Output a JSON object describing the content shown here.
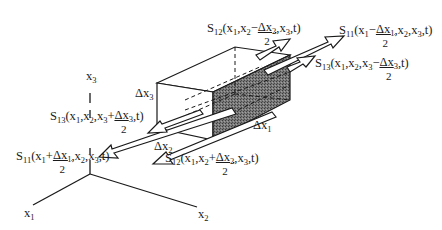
{
  "figure": {
    "type": "3D control-volume stress diagram",
    "axes": {
      "x1": {
        "label": "x",
        "sub": "1"
      },
      "x2": {
        "label": "x",
        "sub": "2"
      },
      "x3": {
        "label": "x",
        "sub": "3"
      }
    },
    "dimensions": {
      "dx1": {
        "label": "Δx",
        "sub": "1"
      },
      "dx2": {
        "label": "Δx",
        "sub": "2"
      },
      "dx3": {
        "label": "Δx",
        "sub": "3"
      }
    },
    "stress_labels": [
      {
        "id": "s12_minus",
        "S": "S",
        "S_sub": "12",
        "pre": "(x",
        "pre_sub": "1",
        "mid": ",x",
        "mid_sub": "2",
        "sign": "−",
        "frac_num": "Δx",
        "frac_num_sub": "2",
        "frac_den": "2",
        "post": ",x",
        "post_sub": "3",
        "end": ",t)"
      },
      {
        "id": "s11_minus",
        "S": "S",
        "S_sub": "11",
        "pre": "(x",
        "pre_sub": "1",
        "sign": "−",
        "frac_num": "Δx",
        "frac_num_sub": "1",
        "frac_den": "2",
        "post": ",x",
        "post_sub": "2",
        "post2": ",x",
        "post2_sub": "3",
        "end": ",t)"
      },
      {
        "id": "s13_minus",
        "S": "S",
        "S_sub": "13",
        "pre": "(x",
        "pre_sub": "1",
        "mid": ",x",
        "mid_sub": "2",
        "mid2": ",x",
        "mid2_sub": "3",
        "sign": "−",
        "frac_num": "Δx",
        "frac_num_sub": "3",
        "frac_den": "2",
        "end": ",t)"
      },
      {
        "id": "s13_plus",
        "S": "S",
        "S_sub": "13",
        "pre": "(x",
        "pre_sub": "1",
        "mid": ",x",
        "mid_sub": "2",
        "mid2": ",x",
        "mid2_sub": "3",
        "sign": "+",
        "frac_num": "Δx",
        "frac_num_sub": "3",
        "frac_den": "2",
        "end": ",t)"
      },
      {
        "id": "s11_plus",
        "S": "S",
        "S_sub": "11",
        "pre": "(x",
        "pre_sub": "1",
        "sign": "+",
        "frac_num": "Δx",
        "frac_num_sub": "1",
        "frac_den": "2",
        "post": ",x",
        "post_sub": "2",
        "post2": ",x",
        "post2_sub": "3",
        "end": ",t)"
      },
      {
        "id": "s12_plus",
        "S": "S",
        "S_sub": "12",
        "pre": "(x",
        "pre_sub": "1",
        "mid": ",x",
        "mid_sub": "2",
        "sign": "+",
        "frac_num": "Δx",
        "frac_num_sub": "2",
        "frac_den": "2",
        "post": ",x",
        "post_sub": "3",
        "end": ",t)"
      }
    ],
    "colors": {
      "line": "#1a1a1a",
      "shaded_face": "#6e6e6e",
      "background": "#ffffff"
    }
  }
}
